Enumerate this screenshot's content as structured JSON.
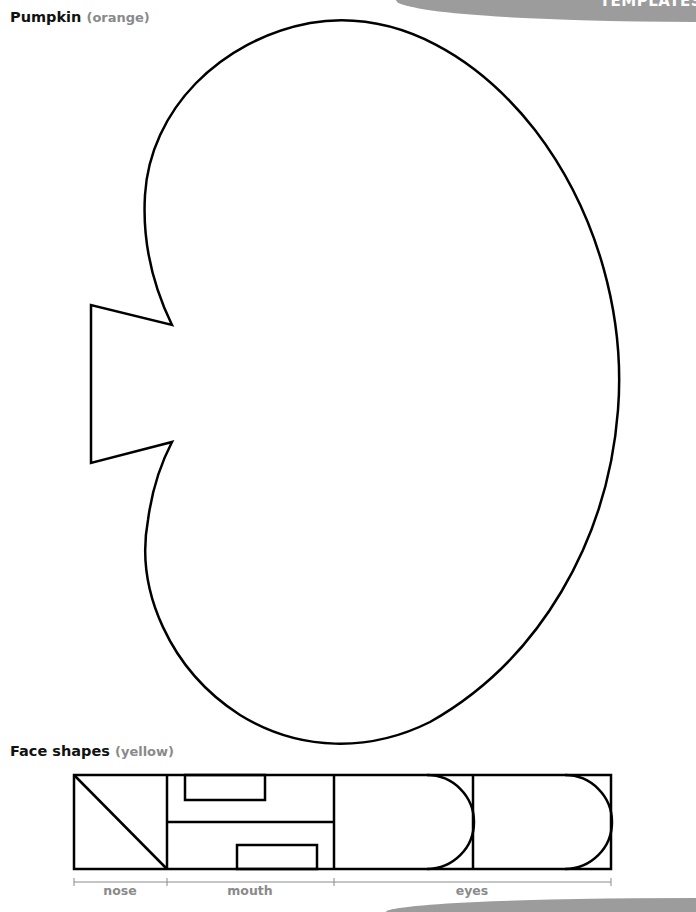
{
  "header": {
    "banner_label": "TEMPLATES"
  },
  "pumpkin": {
    "title": "Pumpkin",
    "color_hint": "(orange)"
  },
  "face_shapes": {
    "title": "Face shapes",
    "color_hint": "(yellow)",
    "labels": {
      "nose": "nose",
      "mouth": "mouth",
      "eyes": "eyes"
    }
  },
  "colors": {
    "banner": "#9c9c9c",
    "outline": "#000000",
    "hint_text": "#8a8a8a"
  }
}
